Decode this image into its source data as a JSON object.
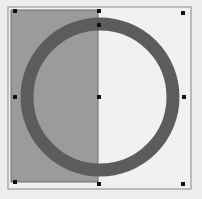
{
  "canvas": {
    "width": 202,
    "height": 199,
    "background": "#ededed"
  },
  "frame": {
    "x": 8,
    "y": 7,
    "width": 183,
    "height": 182,
    "stroke": "#9a9a9a",
    "fill": "#f1f1f1"
  },
  "rectangle_shape": {
    "x": 11,
    "y": 10,
    "width": 87,
    "height": 172,
    "fill": "#9b9b9b",
    "stroke": "#6e6e6e"
  },
  "ring_shape": {
    "cx": 100,
    "cy": 97,
    "r": 73,
    "stroke_width": 13,
    "stroke": "#5c5c5c"
  },
  "selection_handles": [
    {
      "name": "handle-top-left",
      "x": 15,
      "y": 11
    },
    {
      "name": "handle-top-center",
      "x": 99,
      "y": 11
    },
    {
      "name": "handle-top-right",
      "x": 183,
      "y": 13
    },
    {
      "name": "handle-middle-left",
      "x": 15,
      "y": 97
    },
    {
      "name": "handle-center",
      "x": 99,
      "y": 97
    },
    {
      "name": "handle-middle-right",
      "x": 184,
      "y": 97
    },
    {
      "name": "handle-bottom-left",
      "x": 15,
      "y": 182
    },
    {
      "name": "handle-bottom-center",
      "x": 99,
      "y": 184
    },
    {
      "name": "handle-bottom-right",
      "x": 183,
      "y": 184
    },
    {
      "name": "handle-ring-top",
      "x": 99,
      "y": 25
    }
  ],
  "handle_style": {
    "size": 4,
    "fill": "#111111"
  }
}
